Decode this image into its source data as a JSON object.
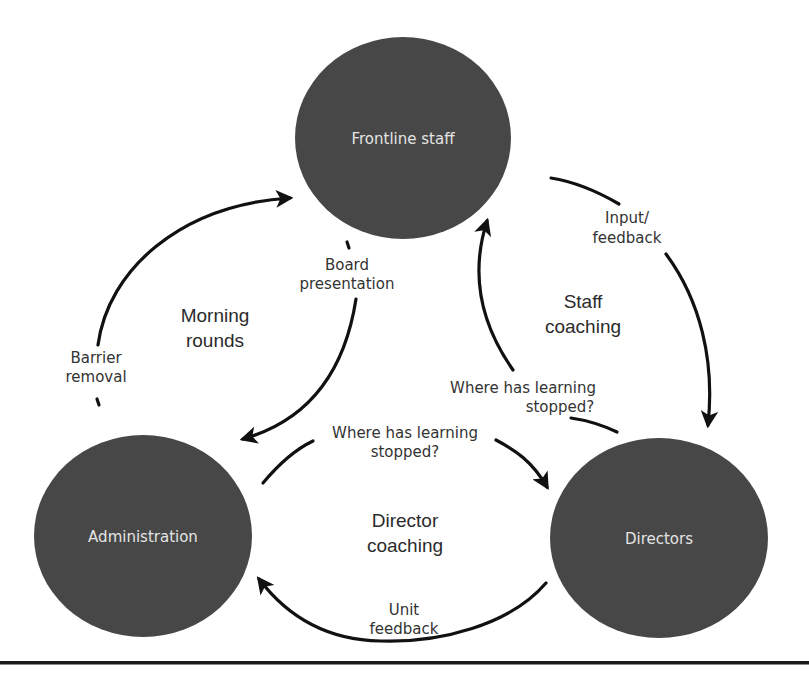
{
  "diagram": {
    "type": "cycle-diagram",
    "colors": {
      "node_fill": "#474747",
      "node_text": "#e4e4e4",
      "arrow": "#111111",
      "label_text": "#333333",
      "background": "#ffffff",
      "bottom_rule": "#1a1a1a"
    },
    "nodes": [
      {
        "id": "frontline",
        "label": "Frontline staff"
      },
      {
        "id": "administration",
        "label": "Administration"
      },
      {
        "id": "directors",
        "label": "Directors"
      }
    ],
    "loops": [
      {
        "id": "morning-rounds",
        "line1": "Morning",
        "line2": "rounds"
      },
      {
        "id": "staff-coaching",
        "line1": "Staff",
        "line2": "coaching"
      },
      {
        "id": "director-coaching",
        "line1": "Director",
        "line2": "coaching"
      }
    ],
    "edges": [
      {
        "id": "barrier-removal",
        "from": "administration",
        "to": "frontline",
        "line1": "Barrier",
        "line2": "removal"
      },
      {
        "id": "board-presentation",
        "from": "frontline",
        "to": "administration",
        "line1": "Board",
        "line2": "presentation"
      },
      {
        "id": "input-feedback",
        "from": "frontline",
        "to": "directors",
        "line1": "Input/",
        "line2": "feedback"
      },
      {
        "id": "where-learning-stopped-right",
        "from": "directors",
        "to": "frontline",
        "line1": "Where has learning",
        "line2": "stopped?"
      },
      {
        "id": "where-learning-stopped-bottom",
        "from": "administration",
        "to": "directors",
        "line1": "Where has learning",
        "line2": "stopped?"
      },
      {
        "id": "unit-feedback",
        "from": "directors",
        "to": "administration",
        "line1": "Unit",
        "line2": "feedback"
      }
    ]
  }
}
